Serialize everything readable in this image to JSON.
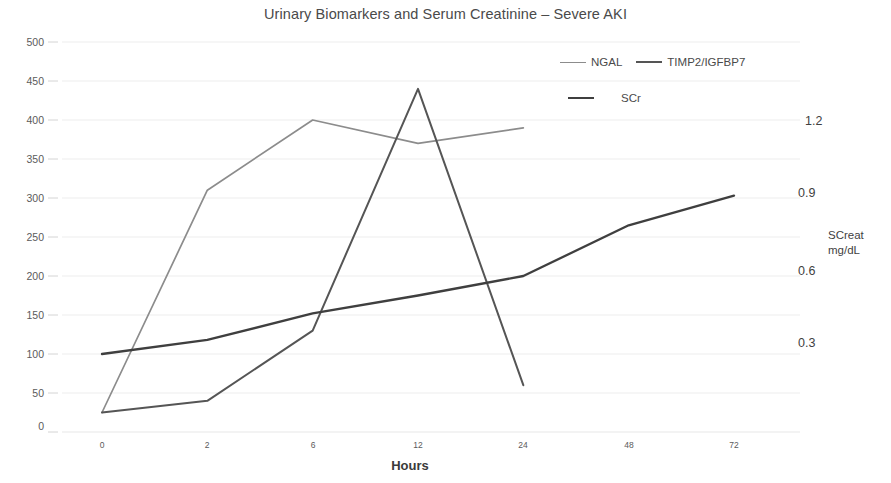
{
  "chart_data": {
    "type": "line",
    "title": "Urinary Biomarkers and Serum Creatinine – Severe AKI",
    "xlabel": "Hours",
    "ylabel": "",
    "y2label": "SCreat\nmg/dL",
    "y2label_line1": "SCreat",
    "y2label_line2": "mg/dL",
    "categories": [
      "0",
      "2",
      "6",
      "12",
      "24",
      "48",
      "72"
    ],
    "x": [
      0,
      2,
      6,
      12,
      24,
      48,
      72
    ],
    "ylim": [
      0,
      500
    ],
    "y_ticks": [
      "0",
      "50",
      "100",
      "150",
      "200",
      "250",
      "300",
      "350",
      "400",
      "450",
      "500"
    ],
    "y2lim": [
      0,
      1.5
    ],
    "y2_ticks": [
      "0.3",
      "0.6",
      "0.9",
      "1.2"
    ],
    "grid": true,
    "legend_position": "top-right",
    "series": [
      {
        "name": "NGAL",
        "axis": "left",
        "color": "#8c8c8c",
        "values": [
          25,
          310,
          400,
          370,
          390,
          null,
          null
        ]
      },
      {
        "name": "TIMP2/IGFBP7",
        "axis": "left",
        "color": "#555555",
        "values": [
          25,
          40,
          130,
          440,
          60,
          null,
          null
        ]
      },
      {
        "name": "SCr",
        "axis": "right",
        "color": "#3f3f3f",
        "values_left_scale": [
          100,
          118,
          152,
          175,
          200,
          265,
          303
        ],
        "values": [
          0.3,
          0.35,
          0.46,
          0.53,
          0.6,
          0.79,
          0.91
        ]
      }
    ]
  },
  "legend": {
    "items": [
      {
        "label": "NGAL"
      },
      {
        "label": "TIMP2/IGFBP7"
      },
      {
        "label": "SCr"
      }
    ]
  },
  "colors": {
    "ngal": "#8c8c8c",
    "timp2": "#555555",
    "scr": "#3f3f3f",
    "grid": "#e8e8e8",
    "text": "#4a4a4a",
    "background": "#ffffff"
  }
}
